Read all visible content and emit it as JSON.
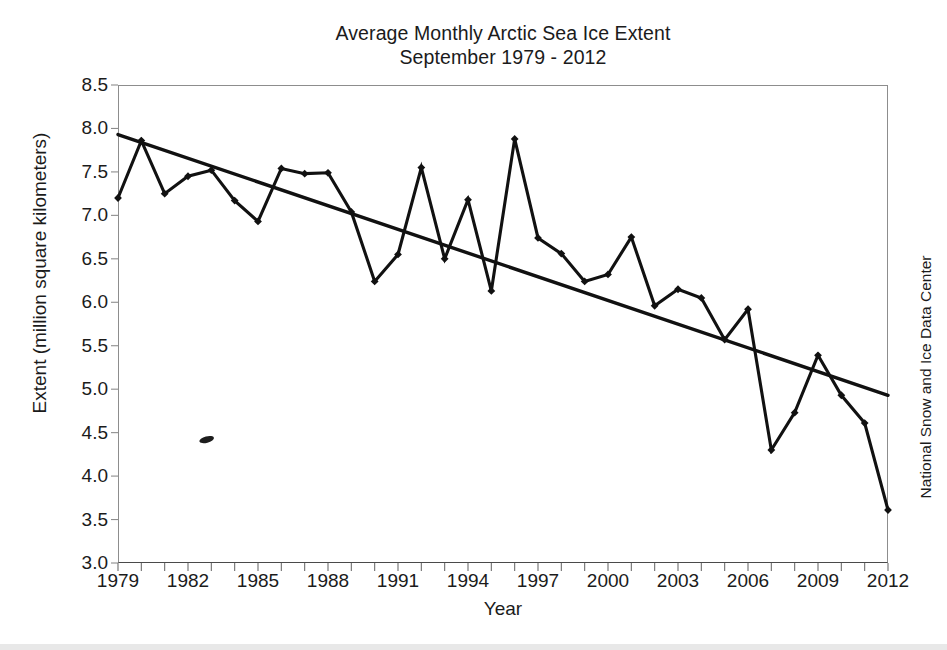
{
  "chart_data": {
    "type": "line",
    "title": "Average Monthly Arctic Sea Ice Extent",
    "subtitle": "September 1979 - 2012",
    "xlabel": "Year",
    "ylabel": "Extent (million square kilometers)",
    "credit": "National Snow and Ice Data Center",
    "xlim": [
      1979,
      2012
    ],
    "ylim": [
      3.0,
      8.5
    ],
    "ytick_labels": [
      "8.5",
      "8.0",
      "7.5",
      "7.0",
      "6.5",
      "6.0",
      "5.5",
      "5.0",
      "4.5",
      "4.0",
      "3.5",
      "3.0"
    ],
    "ytick_values": [
      8.5,
      8.0,
      7.5,
      7.0,
      6.5,
      6.0,
      5.5,
      5.0,
      4.5,
      4.0,
      3.5,
      3.0
    ],
    "xtick_labels": [
      "1979",
      "1982",
      "1985",
      "1988",
      "1991",
      "1994",
      "1997",
      "2000",
      "2003",
      "2006",
      "2009",
      "2012"
    ],
    "xtick_values": [
      1979,
      1982,
      1985,
      1988,
      1991,
      1994,
      1997,
      2000,
      2003,
      2006,
      2009,
      2012
    ],
    "xtick_minor_step": 1,
    "grid": false,
    "legend": false,
    "x": [
      1979,
      1980,
      1981,
      1982,
      1983,
      1984,
      1985,
      1986,
      1987,
      1988,
      1989,
      1990,
      1991,
      1992,
      1993,
      1994,
      1995,
      1996,
      1997,
      1998,
      1999,
      2000,
      2001,
      2002,
      2003,
      2004,
      2005,
      2006,
      2007,
      2008,
      2009,
      2010,
      2011,
      2012
    ],
    "series": [
      {
        "name": "September Arctic sea ice extent",
        "marker": "diamond",
        "color": "#111111",
        "values": [
          7.2,
          7.86,
          7.25,
          7.45,
          7.52,
          7.17,
          6.93,
          7.54,
          7.48,
          7.49,
          7.04,
          6.24,
          6.55,
          7.55,
          6.5,
          7.18,
          6.13,
          7.88,
          6.74,
          6.56,
          6.24,
          6.32,
          6.75,
          5.96,
          6.15,
          6.05,
          5.57,
          5.92,
          4.3,
          4.73,
          5.39,
          4.93,
          4.61,
          3.61
        ]
      }
    ],
    "trend_line": {
      "name": "Linear trend",
      "color": "#111111",
      "start": {
        "x": 1979,
        "y": 7.93
      },
      "end": {
        "x": 2012,
        "y": 4.93
      }
    },
    "artifacts": [
      {
        "name": "scan-smudge",
        "x": 1982.8,
        "y": 4.42
      }
    ]
  }
}
